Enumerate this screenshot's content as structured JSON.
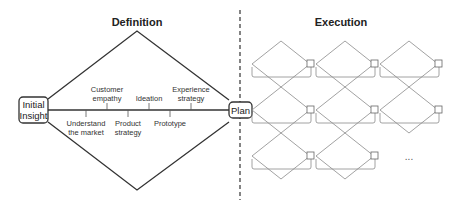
{
  "definition": {
    "title": "Definition",
    "start_node": {
      "line1": "Initial",
      "line2": "Insight"
    },
    "end_node": "Plan",
    "upper_labels": [
      {
        "line1": "Customer",
        "line2": "empathy"
      },
      {
        "line1": "",
        "line2": "Ideation"
      },
      {
        "line1": "Experience",
        "line2": "strategy"
      }
    ],
    "lower_labels": [
      {
        "line1": "Understand",
        "line2": "the market"
      },
      {
        "line1": "Product",
        "line2": "strategy"
      },
      {
        "line1": "Prototype",
        "line2": ""
      }
    ]
  },
  "execution": {
    "title": "Execution",
    "rows": [
      3,
      3,
      2
    ],
    "ellipsis": "..."
  },
  "colors": {
    "stroke_dark": "#333333",
    "stroke_light": "#8a8a8a",
    "divider": "#333333"
  }
}
